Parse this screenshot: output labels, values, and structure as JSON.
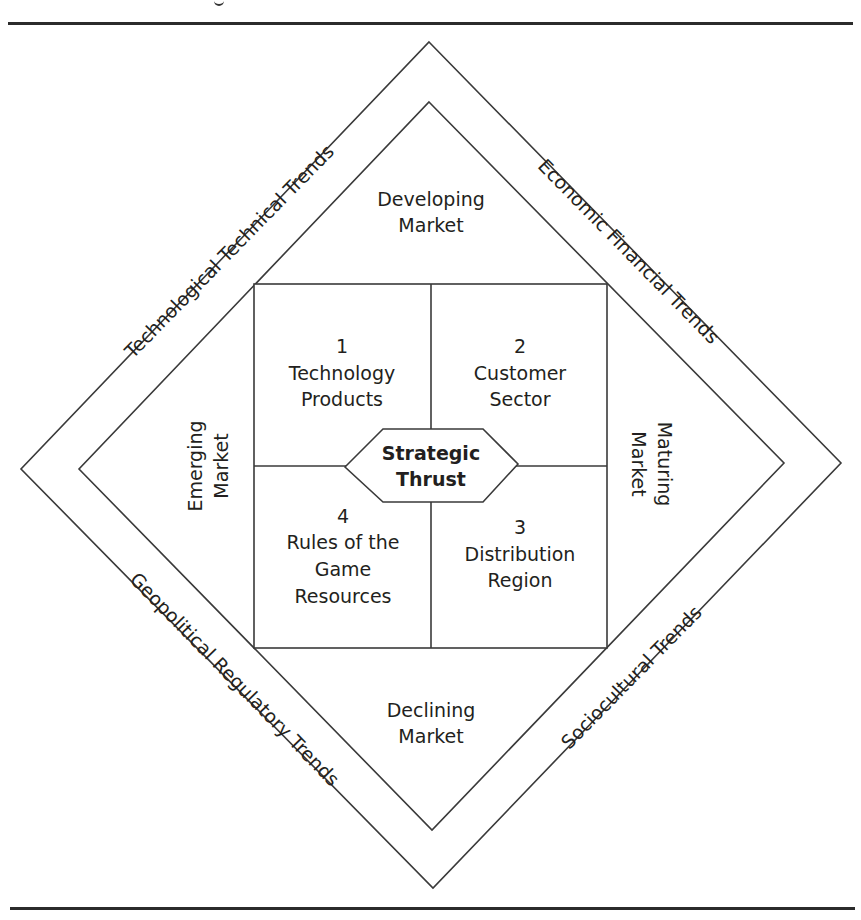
{
  "diagram": {
    "type": "nested-diamond-framework",
    "center": {
      "label_line1": "Strategic",
      "label_line2": "Thrust"
    },
    "quadrants": [
      {
        "number": "1",
        "line1": "Technology",
        "line2": "Products",
        "line3": ""
      },
      {
        "number": "2",
        "line1": "Customer",
        "line2": "Sector",
        "line3": ""
      },
      {
        "number": "3",
        "line1": "Distribution",
        "line2": "Region",
        "line3": ""
      },
      {
        "number": "4",
        "line1": "Rules of the",
        "line2": "Game",
        "line3": "Resources"
      }
    ],
    "markets": {
      "top": {
        "line1": "Developing",
        "line2": "Market"
      },
      "right": {
        "line1": "Maturing",
        "line2": "Market"
      },
      "bottom": {
        "line1": "Declining",
        "line2": "Market"
      },
      "left": {
        "line1": "Emerging",
        "line2": "Market"
      }
    },
    "trends": {
      "top_left": "Technological Technical Trends",
      "top_right": "Economic Financial Trends",
      "bottom_right": "Sociocultural Trends",
      "bottom_left": "Geopolitical Regulatory Trends"
    },
    "colors": {
      "line": "#3a3a3a",
      "text": "#231f20",
      "background": "#ffffff"
    }
  }
}
